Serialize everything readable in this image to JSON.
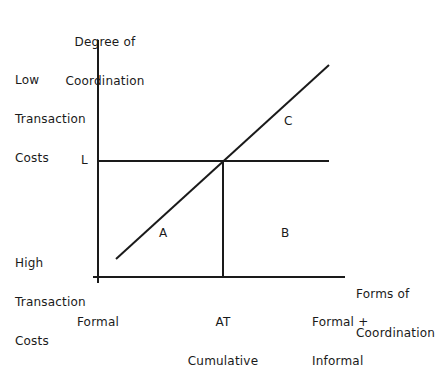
{
  "y_axis": {
    "title_line1": "Degree of",
    "title_line2": "Coordination",
    "top_label": [
      "Low",
      "Transaction",
      "Costs"
    ],
    "bottom_label": [
      "High",
      "Transaction",
      "Costs"
    ],
    "level_marker": "L"
  },
  "x_axis": {
    "title_line1": "Forms of",
    "title_line2": "Coordination",
    "ticks": [
      {
        "line1": "Formal",
        "line2": ""
      },
      {
        "line1": "AT",
        "line2": "Cumulative"
      },
      {
        "line1": "Formal +",
        "line2": "Informal"
      }
    ]
  },
  "regions": {
    "a": "A",
    "b": "B",
    "c": "C"
  },
  "colors": {
    "line": "#1a1a1a",
    "background": "#ffffff"
  }
}
